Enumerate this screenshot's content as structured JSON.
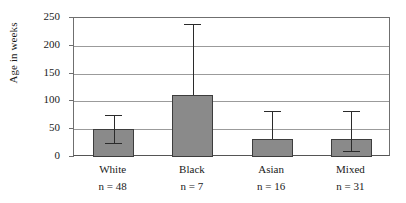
{
  "chart_data": {
    "type": "bar",
    "title": "",
    "xlabel": "",
    "ylabel": "Age in weeks",
    "categories": [
      "White",
      "Black",
      "Asian",
      "Mixed"
    ],
    "values": [
      50,
      112,
      33,
      33
    ],
    "sample_sizes": [
      "n = 48",
      "n = 7",
      "n = 16",
      "n = 31"
    ],
    "sample_size_values": [
      48,
      7,
      16,
      31
    ],
    "error_bars": [
      {
        "category": "White",
        "lower": 25,
        "upper": 75
      },
      {
        "category": "Black",
        "lower": null,
        "upper": 240
      },
      {
        "category": "Asian",
        "lower": null,
        "upper": 82
      },
      {
        "category": "Mixed",
        "lower": 11,
        "upper": 83
      }
    ],
    "ylim": [
      0,
      250
    ],
    "yticks": [
      0,
      50,
      100,
      150,
      200,
      250
    ],
    "ytick_labels": [
      "0",
      "50",
      "100",
      "150",
      "200",
      "250"
    ],
    "grid": true,
    "grid_axis": "y",
    "legend": false,
    "bar_color": "#8a8a8a",
    "bar_edge_color": "#3d3d3d",
    "error_bar_color": "#2b2b2b",
    "gridline_color": "#9b9b9b",
    "axis_color": "#6f6f6f"
  }
}
